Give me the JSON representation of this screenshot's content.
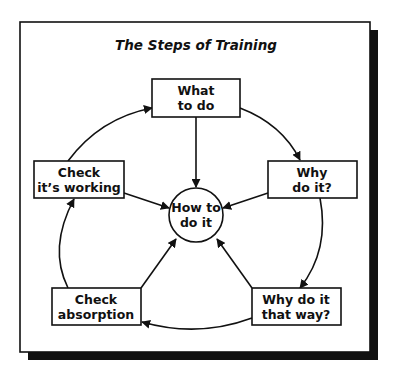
{
  "title": "The Steps of Training",
  "center": {
    "line1": "How to",
    "line2": "do it"
  },
  "steps": [
    {
      "line1": "What",
      "line2": "to do"
    },
    {
      "line1": "Why",
      "line2": "do it?"
    },
    {
      "line1": "Why do it",
      "line2": "that way?"
    },
    {
      "line1": "Check",
      "line2": "absorption"
    },
    {
      "line1": "Check",
      "line2": "it’s working"
    }
  ]
}
